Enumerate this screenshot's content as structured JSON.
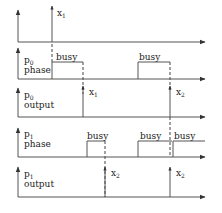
{
  "diagram": {
    "rows": [
      {
        "id": "input",
        "label_main": "",
        "label_line2": "",
        "baseline_y": 42,
        "events": [
          {
            "x": 52,
            "label": "x",
            "sub": "1"
          }
        ]
      },
      {
        "id": "p0-phase",
        "label_main": "p",
        "label_sub": "0",
        "label_line2": "phase",
        "baseline_y": 79,
        "pulses": [
          {
            "x1": 52,
            "x2": 83,
            "label": "busy"
          },
          {
            "x1": 138,
            "x2": 170,
            "label": "busy"
          }
        ]
      },
      {
        "id": "p0-output",
        "label_main": "p",
        "label_sub": "0",
        "label_line2": "output",
        "baseline_y": 117,
        "events": [
          {
            "x": 83,
            "label": "x",
            "sub": "1"
          },
          {
            "x": 170,
            "label": "x",
            "sub": "2"
          }
        ]
      },
      {
        "id": "p1-phase",
        "label_main": "p",
        "label_sub": "1",
        "label_line2": "phase",
        "baseline_y": 157,
        "pulses": [
          {
            "x1": 87,
            "x2": 105,
            "label": "busy"
          },
          {
            "x1": 138,
            "x2": 172,
            "label": "busy"
          },
          {
            "x1": 172,
            "x2": 205,
            "label": "busy"
          }
        ]
      },
      {
        "id": "p1-output",
        "label_main": "p",
        "label_sub": "1",
        "label_line2": "output",
        "baseline_y": 197,
        "events": [
          {
            "x": 105,
            "label": "x",
            "sub": "2"
          },
          {
            "x": 170,
            "label": "x",
            "sub": "2"
          }
        ]
      }
    ],
    "labels": {
      "busy": "busy",
      "p0": "p",
      "p0_sub": "0",
      "p1": "p",
      "p1_sub": "1",
      "phase": "phase",
      "output": "output",
      "x": "x",
      "sub1": "1",
      "sub2": "2"
    },
    "colors": {
      "line": "#555555",
      "text": "#222222",
      "background": "#ffffff"
    }
  }
}
